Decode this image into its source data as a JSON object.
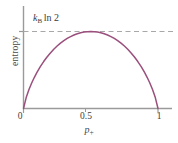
{
  "figure": {
    "background_color": "#ffffff",
    "curve_color": "#9a4f7c",
    "axis_color": "#9a9a9a",
    "dash_color": "#a8a8a8",
    "text_color": "#3d3d3d"
  },
  "labels": {
    "ylabel": "entropy",
    "xlabel_symbol": "p",
    "xlabel_subscript": "+",
    "annotation_symbol": "k",
    "annotation_subscript": "B",
    "annotation_operator": "ln 2"
  },
  "chart_data": {
    "type": "line",
    "title": "",
    "xlabel": "p_+",
    "ylabel": "entropy",
    "annotations": [
      {
        "text": "k_B ln 2",
        "x": 0.18,
        "y": 1.0,
        "note": "maximum entropy level marked by horizontal dashed line"
      }
    ],
    "xlim": [
      0,
      1
    ],
    "ylim": [
      0,
      1.18
    ],
    "xticks": [
      0,
      0.5,
      1
    ],
    "xticklabels": [
      "0",
      "0.5",
      "1"
    ],
    "yticks": [
      1.0
    ],
    "yticklabels": [
      ""
    ],
    "grid": false,
    "legend": null,
    "reference_lines": [
      {
        "orientation": "horizontal",
        "value": 1.0,
        "style": "dashed",
        "color": "#a8a8a8",
        "label": "k_B ln 2"
      }
    ],
    "series": [
      {
        "name": "binary entropy",
        "color": "#9a4f7c",
        "x": [
          0,
          0.02,
          0.04,
          0.06,
          0.08,
          0.1,
          0.125,
          0.15,
          0.175,
          0.2,
          0.225,
          0.25,
          0.275,
          0.3,
          0.325,
          0.35,
          0.375,
          0.4,
          0.425,
          0.45,
          0.475,
          0.5,
          0.525,
          0.55,
          0.575,
          0.6,
          0.625,
          0.65,
          0.675,
          0.7,
          0.725,
          0.75,
          0.775,
          0.8,
          0.825,
          0.85,
          0.875,
          0.9,
          0.92,
          0.94,
          0.96,
          0.98,
          1
        ],
        "y": [
          0,
          0.1414,
          0.2423,
          0.3274,
          0.4022,
          0.469,
          0.5436,
          0.6098,
          0.669,
          0.7219,
          0.7692,
          0.8113,
          0.8485,
          0.8813,
          0.9097,
          0.9341,
          0.9544,
          0.971,
          0.9837,
          0.9928,
          0.9982,
          1.0,
          0.9982,
          0.9928,
          0.9837,
          0.971,
          0.9544,
          0.9341,
          0.9097,
          0.8813,
          0.8485,
          0.8113,
          0.7692,
          0.7219,
          0.669,
          0.6098,
          0.5436,
          0.469,
          0.4022,
          0.3274,
          0.2423,
          0.1414,
          0
        ]
      }
    ]
  }
}
